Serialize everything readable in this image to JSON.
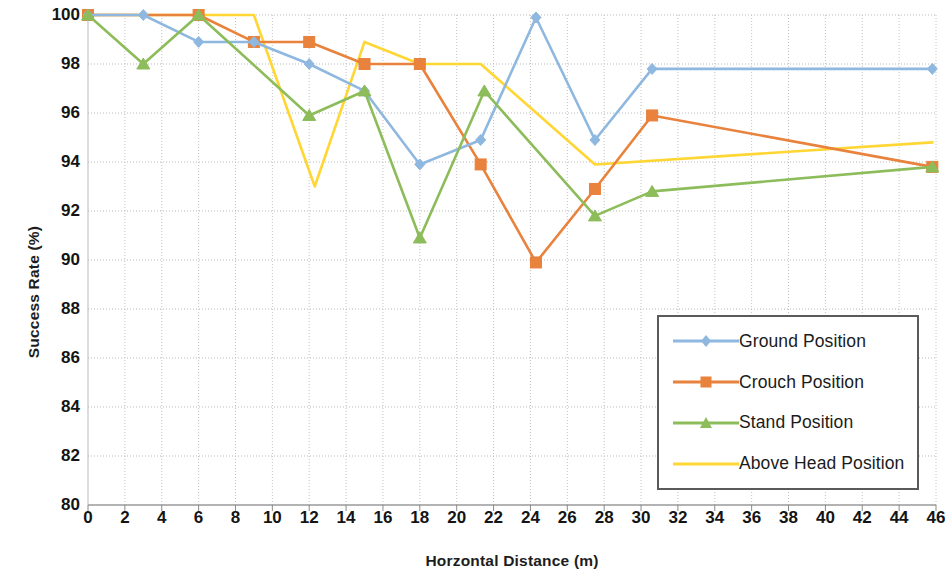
{
  "chart_data": {
    "type": "line",
    "title": "",
    "xlabel": "Horzontal Distance (m)",
    "ylabel": "Success Rate (%)",
    "xlim": [
      0,
      46
    ],
    "ylim": [
      80,
      100
    ],
    "xticks": [
      0,
      2,
      4,
      6,
      8,
      10,
      12,
      14,
      16,
      18,
      20,
      22,
      24,
      26,
      28,
      30,
      32,
      34,
      36,
      38,
      40,
      42,
      44,
      46
    ],
    "yticks": [
      80,
      82,
      84,
      86,
      88,
      90,
      92,
      94,
      96,
      98,
      100
    ],
    "grid": true,
    "legend_position": "inside-bottom-right",
    "series": [
      {
        "name": "Ground Position",
        "color": "#8FB8E0",
        "marker": "diamond",
        "x": [
          0,
          3,
          6,
          9,
          12,
          15,
          18,
          21.3,
          24.3,
          27.5,
          30.6,
          45.8
        ],
        "values": [
          100,
          100,
          98.9,
          98.9,
          98,
          96.9,
          93.9,
          94.9,
          99.9,
          94.9,
          97.8,
          97.8
        ]
      },
      {
        "name": "Crouch Position",
        "color": "#E8823C",
        "marker": "square",
        "x": [
          0,
          6,
          9,
          12,
          15,
          18,
          21.3,
          24.3,
          27.5,
          30.6,
          45.8
        ],
        "values": [
          100,
          100,
          98.9,
          98.9,
          98,
          98,
          93.9,
          89.9,
          92.9,
          95.9,
          93.8
        ]
      },
      {
        "name": "Stand Position",
        "color": "#8DBC5A",
        "marker": "triangle",
        "x": [
          0,
          3,
          6,
          12,
          15,
          18,
          21.5,
          27.5,
          30.6,
          45.8
        ],
        "values": [
          100,
          98,
          100,
          95.9,
          96.9,
          90.9,
          96.9,
          91.8,
          92.8,
          93.8
        ]
      },
      {
        "name": "Above Head Position",
        "color": "#FFD633",
        "marker": "none",
        "x": [
          0,
          3,
          6,
          9,
          12.3,
          15,
          18,
          21.3,
          27.5,
          45.8
        ],
        "values": [
          100,
          100,
          100,
          100,
          93,
          98.9,
          98,
          98,
          93.9,
          94.8
        ]
      }
    ]
  },
  "axes": {
    "y_title": "Success Rate (%)",
    "x_title": "Horzontal Distance (m)"
  },
  "legend": {
    "entries": [
      {
        "label": "Ground Position",
        "color": "#8FB8E0",
        "marker": "diamond"
      },
      {
        "label": "Crouch Position",
        "color": "#E8823C",
        "marker": "square"
      },
      {
        "label": "Stand Position",
        "color": "#8DBC5A",
        "marker": "triangle"
      },
      {
        "label": "Above Head Position",
        "color": "#FFD633",
        "marker": "none"
      }
    ]
  }
}
